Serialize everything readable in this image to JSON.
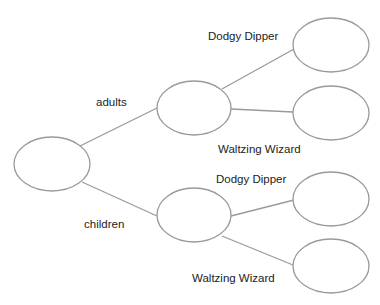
{
  "diagram": {
    "type": "tree-diagram",
    "colors": {
      "stroke": "#9a9a9a",
      "text": "#222222",
      "background": "#ffffff"
    },
    "nodes": {
      "root": {
        "cx": 52,
        "cy": 164,
        "rx": 38,
        "ry": 27,
        "text": ""
      },
      "adults": {
        "cx": 194,
        "cy": 108,
        "rx": 37,
        "ry": 27,
        "text": ""
      },
      "children": {
        "cx": 194,
        "cy": 215,
        "rx": 37,
        "ry": 27,
        "text": ""
      },
      "adults_dodgy": {
        "cx": 331,
        "cy": 45,
        "rx": 38,
        "ry": 27,
        "text": ""
      },
      "adults_waltzing": {
        "cx": 331,
        "cy": 113,
        "rx": 38,
        "ry": 27,
        "text": ""
      },
      "children_dodgy": {
        "cx": 331,
        "cy": 199,
        "rx": 38,
        "ry": 27,
        "text": ""
      },
      "children_waltzing": {
        "cx": 331,
        "cy": 266,
        "rx": 38,
        "ry": 27,
        "text": ""
      }
    },
    "labels": {
      "adults": "adults",
      "children": "children",
      "adults_dodgy": "Dodgy Dipper",
      "adults_waltzing": "Waltzing Wizard",
      "children_dodgy": "Dodgy Dipper",
      "children_waltzing": "Waltzing Wizard"
    }
  }
}
